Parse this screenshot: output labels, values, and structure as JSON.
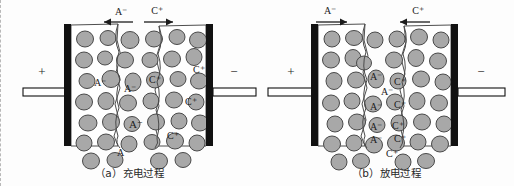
{
  "figure": {
    "background_color": "#fdfdfd",
    "particle_fill": "#a8a8a8",
    "particle_stroke": "#4a4a4a",
    "collector_color": "#111111",
    "ink_color": "#1c1c1c"
  },
  "panels": [
    {
      "id": "a",
      "caption": "（a）充电过程",
      "left_terminal_polarity": "+",
      "right_terminal_polarity": "−",
      "top_arrows": [
        {
          "label": "A⁻",
          "direction": "left"
        },
        {
          "label": "C⁺",
          "direction": "right"
        }
      ],
      "anion_labels": [
        "A⁻",
        "A⁻",
        "A⁻",
        "A"
      ],
      "cation_labels": [
        "C⁺",
        "C⁺",
        "C⁺",
        "C⁺"
      ]
    },
    {
      "id": "b",
      "caption": "（b）放电过程",
      "left_terminal_polarity": "+",
      "right_terminal_polarity": "−",
      "top_arrows": [
        {
          "label": "A⁻",
          "direction": "right"
        },
        {
          "label": "C⁺",
          "direction": "left"
        }
      ],
      "anion_labels": [
        "A⁻",
        "A⁻",
        "A⁻",
        "A⁻",
        "A⁻"
      ],
      "cation_labels": [
        "C⁺",
        "C⁺",
        "C⁺",
        "C⁺",
        "C⁺"
      ]
    }
  ]
}
